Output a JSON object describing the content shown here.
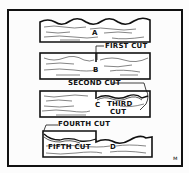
{
  "diagram": {
    "title": "",
    "boards": [
      {
        "id": "A",
        "label": "A"
      },
      {
        "id": "B",
        "label": "B"
      },
      {
        "id": "C",
        "label": "C"
      },
      {
        "id": "D",
        "label": "D"
      }
    ],
    "cuts": [
      {
        "label": "FIRST CUT"
      },
      {
        "label": "SECOND CUT"
      },
      {
        "label": "THIRD",
        "label2": "CUT"
      },
      {
        "label": "FOURTH CUT"
      },
      {
        "label": "FIFTH CUT"
      }
    ],
    "signature_mark": "ᴍ",
    "colors": {
      "ink": "#111111",
      "paper": "#fcfcfc"
    }
  }
}
